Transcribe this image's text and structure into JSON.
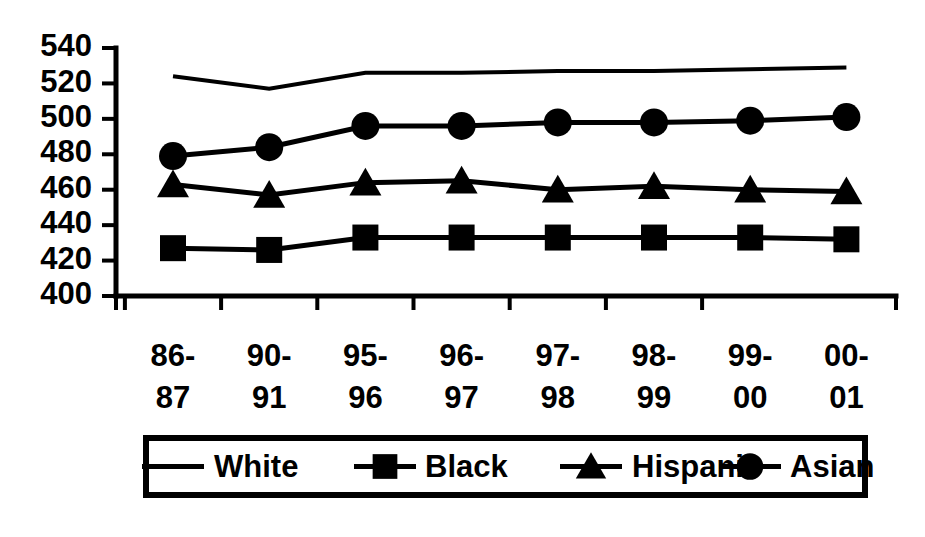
{
  "chart_data": {
    "type": "line",
    "title": "",
    "xlabel": "",
    "ylabel": "",
    "ylim": [
      400,
      540
    ],
    "ytick_step": 20,
    "yticks": [
      400,
      420,
      440,
      460,
      480,
      500,
      520,
      540
    ],
    "grid": false,
    "legend_position": "bottom",
    "categories": [
      "86-87",
      "90-91",
      "95-96",
      "96-97",
      "97-98",
      "98-99",
      "99-00",
      "00-01"
    ],
    "series": [
      {
        "name": "White",
        "marker": "none",
        "color": "#000000",
        "values": [
          524,
          517,
          526,
          526,
          527,
          527,
          528,
          529
        ]
      },
      {
        "name": "Black",
        "marker": "square",
        "color": "#000000",
        "values": [
          427,
          426,
          433,
          433,
          433,
          433,
          433,
          432
        ]
      },
      {
        "name": "Hispanic",
        "marker": "triangle",
        "color": "#000000",
        "values": [
          463,
          457,
          464,
          465,
          460,
          462,
          460,
          459
        ]
      },
      {
        "name": "Asian",
        "marker": "circle",
        "color": "#000000",
        "values": [
          479,
          484,
          496,
          496,
          498,
          498,
          499,
          501
        ]
      }
    ]
  },
  "axes": {
    "y_labels": [
      "540",
      "520",
      "500",
      "480",
      "460",
      "440",
      "420",
      "400"
    ],
    "x_labels": [
      {
        "top": "86-",
        "bottom": "87"
      },
      {
        "top": "90-",
        "bottom": "91"
      },
      {
        "top": "95-",
        "bottom": "96"
      },
      {
        "top": "96-",
        "bottom": "97"
      },
      {
        "top": "97-",
        "bottom": "98"
      },
      {
        "top": "98-",
        "bottom": "99"
      },
      {
        "top": "99-",
        "bottom": "00"
      },
      {
        "top": "00-",
        "bottom": "01"
      }
    ]
  },
  "legend": {
    "entries": [
      {
        "label": "White",
        "marker": "none"
      },
      {
        "label": "Black",
        "marker": "square"
      },
      {
        "label": "Hispanic",
        "marker": "triangle"
      },
      {
        "label": "Asian",
        "marker": "circle"
      }
    ]
  }
}
